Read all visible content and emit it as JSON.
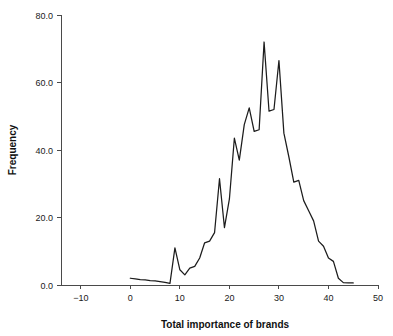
{
  "chart_data": {
    "type": "line",
    "title": "",
    "subtitle": "",
    "xlabel": "Total importance of brands",
    "ylabel": "Frequency",
    "xlim": [
      -14,
      50
    ],
    "ylim": [
      0,
      80
    ],
    "xticks": [
      -10,
      0,
      10,
      20,
      30,
      40,
      50
    ],
    "xtick_labels": [
      "−10",
      "0",
      "10",
      "20",
      "30",
      "40",
      "50"
    ],
    "yticks": [
      0,
      20,
      40,
      60,
      80
    ],
    "ytick_labels": [
      "0.0",
      "20.0",
      "40.0",
      "60.0",
      "80.0"
    ],
    "grid": false,
    "legend": null,
    "legend_position": "none",
    "annotations": [],
    "series": [
      {
        "name": "Total importance of brands",
        "color": "#1c1c1c",
        "x": [
          0,
          1,
          2,
          3,
          4,
          5,
          6,
          7,
          8,
          9,
          10,
          11,
          12,
          13,
          14,
          15,
          16,
          17,
          18,
          19,
          20,
          21,
          22,
          23,
          24,
          25,
          26,
          27,
          28,
          29,
          30,
          31,
          32,
          33,
          34,
          35,
          36,
          37,
          38,
          39,
          40,
          41,
          42,
          43,
          44,
          45
        ],
        "y": [
          2.0,
          1.8,
          1.6,
          1.5,
          1.3,
          1.2,
          1.0,
          0.8,
          0.5,
          11.0,
          4.5,
          3.0,
          5.0,
          5.5,
          8.0,
          12.5,
          13.0,
          15.5,
          31.5,
          17.0,
          25.5,
          43.5,
          37.0,
          47.5,
          52.5,
          45.5,
          46.0,
          72.0,
          51.5,
          52.0,
          66.5,
          45.0,
          38.0,
          30.5,
          31.0,
          25.0,
          22.0,
          19.0,
          13.0,
          11.5,
          8.0,
          7.0,
          2.0,
          0.7,
          0.6,
          0.6
        ]
      }
    ]
  },
  "axes": {
    "x_title": "Total importance of brands",
    "y_title": "Frequency"
  }
}
